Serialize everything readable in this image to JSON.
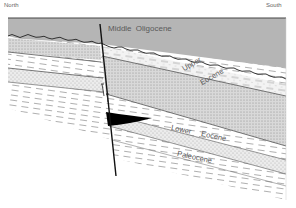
{
  "diagram": {
    "type": "geologic-cross-section",
    "orientation": {
      "left": "North",
      "right": "South"
    },
    "layers": [
      {
        "id": "middle-oligocene",
        "label": "Middle  Oligocene",
        "fill": "#b3b3b3",
        "pattern": "solid-grey"
      },
      {
        "id": "upper-eocene",
        "label_line1": "Upper",
        "label_line2": "Eocene",
        "fill": "#cfcfcf",
        "pattern": "stipple"
      },
      {
        "id": "lower-eocene",
        "label_line1": "Lower",
        "label_line2": "Eocene",
        "fill": "#e6e6e6",
        "pattern": "dash-stipple"
      },
      {
        "id": "paleocene",
        "label": "Paleocene",
        "fill": "#f2f2f2",
        "pattern": "dashes"
      }
    ],
    "features": {
      "fault": "normal fault (steep, dipping)",
      "wedge": "black wedge at fault (lower eocene)",
      "unconformity": "wavy erosional surface below Middle Oligocene"
    },
    "colors": {
      "oligocene": "#b3b3b3",
      "stipple": "#d3d3d3",
      "line": "#4a4a4a",
      "fault": "#111111",
      "wedge": "#000000"
    }
  }
}
